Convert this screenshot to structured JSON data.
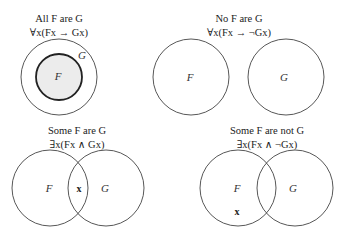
{
  "panels": [
    {
      "title": "All F are G",
      "formula": "∀x(Fx → Gx)",
      "labels": {
        "F": "F",
        "G": "G"
      }
    },
    {
      "title": "No F are G",
      "formula": "∀x(Fx → ¬Gx)",
      "labels": {
        "F": "F",
        "G": "G"
      }
    },
    {
      "title": "Some F are G",
      "formula": "∃x(Fx ∧ Gx)",
      "labels": {
        "F": "F",
        "G": "G"
      },
      "marker": "x"
    },
    {
      "title": "Some F are not G",
      "formula": "∃x(Fx ∧ ¬Gx)",
      "labels": {
        "F": "F",
        "G": "G"
      },
      "marker": "x"
    }
  ],
  "colors": {
    "stroke": "#444444",
    "inner_fill": "#ececec",
    "text": "#222222"
  }
}
